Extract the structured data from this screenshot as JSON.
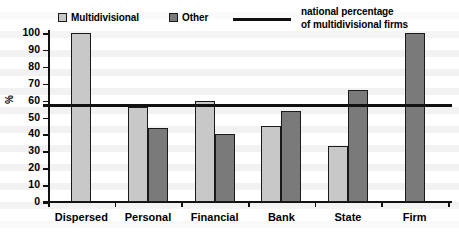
{
  "chart_data": {
    "type": "bar",
    "title": "",
    "xlabel": "",
    "ylabel": "%",
    "ylim": [
      0,
      100
    ],
    "ytick_values": [
      100,
      90,
      80,
      70,
      60,
      50,
      40,
      30,
      20,
      10,
      0
    ],
    "ytick_labels": [
      "100",
      "90",
      "80",
      "70",
      "60",
      "50",
      "40",
      "30",
      "20",
      "10",
      "0"
    ],
    "grid": false,
    "legend_position": "top",
    "categories": [
      "Dispersed",
      "Personal",
      "Financial",
      "Bank",
      "State",
      "Firm"
    ],
    "series": [
      {
        "name": "Multidivisional",
        "color": "#c8c8c8",
        "values": [
          100,
          56,
          60,
          45,
          33,
          null
        ]
      },
      {
        "name": "Other",
        "color": "#7a7a7a",
        "values": [
          null,
          44,
          40,
          54,
          66,
          100
        ]
      }
    ],
    "reference_line": {
      "label_line1": "national percentage",
      "label_line2": "of multidivisional firms",
      "value": 58,
      "color": "#111111"
    }
  },
  "legend": {
    "entries": [
      {
        "label": "Multidivisional",
        "swatch": "#c8c8c8"
      },
      {
        "label": "Other",
        "swatch": "#7a7a7a"
      }
    ],
    "note_line1": "national percentage",
    "note_line2": "of multidivisional firms"
  },
  "axis": {
    "y_label": "%"
  }
}
